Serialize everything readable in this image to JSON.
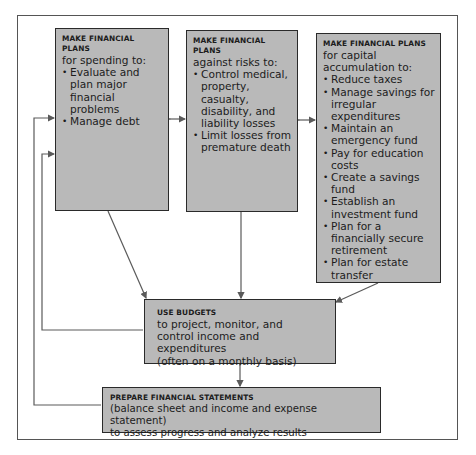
{
  "diagram": {
    "type": "flowchart",
    "boxes": {
      "spending": {
        "heading": "MAKE FINANCIAL PLANS",
        "subheading": "for spending to:",
        "items": [
          "Evaluate and plan major financial problems",
          "Manage debt"
        ]
      },
      "risks": {
        "heading": "MAKE FINANCIAL PLANS",
        "subheading": "against risks to:",
        "items": [
          "Control medical, property, casualty, disability, and liability losses",
          "Limit losses from premature death"
        ]
      },
      "capital": {
        "heading": "MAKE FINANCIAL PLANS",
        "subheading": "for capital accumulation to:",
        "items": [
          "Reduce taxes",
          "Manage savings for irregular expenditures",
          "Maintain an emergency fund",
          "Pay for education costs",
          "Create a savings fund",
          "Establish an investment fund",
          "Plan for a financially secure retirement",
          "Plan for estate transfer"
        ]
      },
      "budgets": {
        "heading": "USE BUDGETS",
        "lines": [
          "to project, monitor, and",
          "control income and expenditures",
          "(often on a monthly basis)"
        ]
      },
      "statements": {
        "heading": "PREPARE FINANCIAL STATEMENTS",
        "lines": [
          "(balance sheet and income and expense statement)",
          "to assess progress and analyze results"
        ]
      }
    },
    "connections": [
      {
        "from": "spending",
        "to": "risks",
        "type": "bidirectional"
      },
      {
        "from": "risks",
        "to": "capital",
        "type": "bidirectional"
      },
      {
        "from": "spending",
        "to": "budgets",
        "type": "arrow"
      },
      {
        "from": "risks",
        "to": "budgets",
        "type": "arrow"
      },
      {
        "from": "capital",
        "to": "budgets",
        "type": "arrow"
      },
      {
        "from": "budgets",
        "to": "statements",
        "type": "bidirectional"
      },
      {
        "from": "budgets",
        "to": "spending",
        "type": "feedback"
      },
      {
        "from": "statements",
        "to": "spending",
        "type": "feedback"
      }
    ],
    "colors": {
      "box_fill": "#b9b9b9",
      "box_border": "#2a2a2a",
      "line": "#5a5a5a"
    }
  }
}
